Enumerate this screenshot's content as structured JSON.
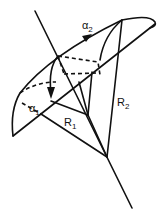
{
  "diagram": {
    "labels": {
      "alpha2": {
        "main": "α",
        "sub": "2"
      },
      "alpha1": {
        "main": "α",
        "sub": "1"
      },
      "r1": {
        "main": "R",
        "sub": "1"
      },
      "r2": {
        "main": "R",
        "sub": "2"
      }
    },
    "colors": {
      "stroke": "#111111",
      "background": "#ffffff"
    }
  }
}
